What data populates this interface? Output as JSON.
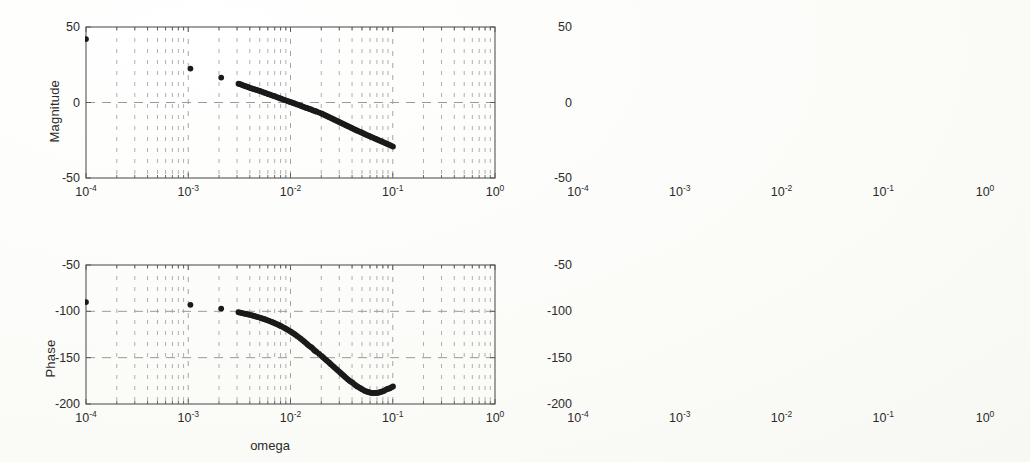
{
  "figure": {
    "kind": "bode-plot-figure",
    "panel_count": 4,
    "background_color": "#fdfdfb",
    "line_color": "#1a1a1a",
    "grid_color": "#9a9a9a",
    "axis_color": "#555555"
  },
  "labels": {
    "magnitude": "Magnitude",
    "phase": "Phase",
    "omega": "omega"
  },
  "x_ticks": [
    {
      "mantissa": "10",
      "exponent": "-4",
      "value": 0.0001
    },
    {
      "mantissa": "10",
      "exponent": "-3",
      "value": 0.001
    },
    {
      "mantissa": "10",
      "exponent": "-2",
      "value": 0.01
    },
    {
      "mantissa": "10",
      "exponent": "-1",
      "value": 0.1
    },
    {
      "mantissa": "10",
      "exponent": "0",
      "value": 1
    }
  ],
  "mag_y_ticks": [
    "50",
    "0",
    "-50"
  ],
  "phase_y_ticks": [
    "-50",
    "-100",
    "-150",
    "-200"
  ],
  "chart_data": [
    {
      "id": "magnitude-left",
      "type": "scatter",
      "title": "",
      "xlabel": "",
      "ylabel": "Magnitude",
      "xscale": "log",
      "xlim": [
        0.0001,
        1
      ],
      "ylim": [
        -50,
        50
      ],
      "yticks": [
        50,
        0,
        -50
      ],
      "xticks": [
        0.0001,
        0.001,
        0.01,
        0.1,
        1
      ],
      "grid": true,
      "legend": "none",
      "marker": "filled-circle",
      "x": [
        0.0001,
        0.00105,
        0.0021,
        0.0031,
        0.0041,
        0.0051,
        0.0061,
        0.0071,
        0.0081,
        0.0091,
        0.0101,
        0.0111,
        0.0121,
        0.0131,
        0.0141,
        0.0151,
        0.0161,
        0.0171,
        0.0181,
        0.0191,
        0.0201,
        0.0215,
        0.0231,
        0.0248,
        0.0266,
        0.0285,
        0.0306,
        0.0328,
        0.0352,
        0.0378,
        0.0405,
        0.0435,
        0.0466,
        0.05,
        0.0536,
        0.0575,
        0.0617,
        0.0662,
        0.071,
        0.0761,
        0.0816,
        0.0875,
        0.0938,
        0.1005
      ],
      "y": [
        42,
        22.5,
        16.5,
        12.5,
        9.5,
        7.5,
        5.5,
        4.0,
        2.5,
        1.3,
        0.2,
        -0.8,
        -1.7,
        -2.6,
        -3.4,
        -4.1,
        -4.8,
        -5.5,
        -6.1,
        -6.7,
        -7.3,
        -8.2,
        -9.2,
        -10.2,
        -11.2,
        -12.2,
        -13.2,
        -14.2,
        -15.2,
        -16.2,
        -17.2,
        -18.2,
        -19.1,
        -20.0,
        -21.0,
        -21.9,
        -22.8,
        -23.7,
        -24.6,
        -25.5,
        -26.4,
        -27.3,
        -28.2,
        -29.2
      ]
    },
    {
      "id": "magnitude-right",
      "type": "scatter",
      "title": "",
      "xlabel": "",
      "ylabel": "Magnitude",
      "xscale": "log",
      "xlim": [
        0.0001,
        1
      ],
      "ylim": [
        -50,
        50
      ],
      "yticks": [
        50,
        0,
        -50
      ],
      "xticks": [
        0.0001,
        0.001,
        0.01,
        0.1,
        1
      ],
      "grid": true,
      "legend": "none",
      "marker": "filled-circle",
      "x": [
        0.0001,
        0.00105,
        0.0021,
        0.0031,
        0.0041,
        0.0051,
        0.0061,
        0.0071,
        0.0081,
        0.0091,
        0.0101,
        0.0111,
        0.0121,
        0.0131,
        0.0141,
        0.0151,
        0.0161,
        0.0171,
        0.0181,
        0.0191,
        0.0201,
        0.0215,
        0.0231,
        0.0248,
        0.0266,
        0.0285,
        0.0306,
        0.0328,
        0.0352,
        0.0378,
        0.0405,
        0.0435,
        0.0466,
        0.05,
        0.0536,
        0.0575,
        0.0617,
        0.0662,
        0.071,
        0.0761,
        0.0816,
        0.0875,
        0.0938,
        0.1005
      ],
      "y": [
        42,
        22.5,
        16.5,
        12.5,
        9.5,
        7.5,
        5.5,
        4.0,
        2.5,
        1.3,
        0.2,
        -0.8,
        -1.7,
        -2.6,
        -3.4,
        -4.1,
        -4.8,
        -5.5,
        -6.1,
        -6.7,
        -7.3,
        -8.2,
        -9.2,
        -10.2,
        -11.2,
        -12.2,
        -13.2,
        -14.2,
        -15.2,
        -16.2,
        -17.2,
        -18.2,
        -19.1,
        -20.0,
        -21.0,
        -21.9,
        -22.8,
        -23.7,
        -24.6,
        -25.5,
        -26.4,
        -27.3,
        -28.2,
        -29.2
      ]
    },
    {
      "id": "phase-left",
      "type": "scatter",
      "title": "",
      "xlabel": "omega",
      "ylabel": "Phase",
      "xscale": "log",
      "xlim": [
        0.0001,
        1
      ],
      "ylim": [
        -200,
        -50
      ],
      "yticks": [
        -50,
        -100,
        -150,
        -200
      ],
      "xticks": [
        0.0001,
        0.001,
        0.01,
        0.1,
        1
      ],
      "grid": true,
      "legend": "none",
      "marker": "filled-circle",
      "x": [
        0.0001,
        0.00105,
        0.0021,
        0.0031,
        0.0041,
        0.0051,
        0.0061,
        0.0071,
        0.0081,
        0.0091,
        0.0101,
        0.0111,
        0.0121,
        0.0131,
        0.0141,
        0.0151,
        0.0161,
        0.0171,
        0.0181,
        0.0191,
        0.0201,
        0.0215,
        0.0231,
        0.0248,
        0.0266,
        0.0285,
        0.0306,
        0.0328,
        0.0352,
        0.0378,
        0.0405,
        0.0435,
        0.0466,
        0.05,
        0.0536,
        0.0575,
        0.0617,
        0.0662,
        0.071,
        0.0761,
        0.0816,
        0.0875,
        0.0938,
        0.1005
      ],
      "y": [
        -90,
        -93,
        -97,
        -101,
        -104,
        -107,
        -110,
        -113,
        -116,
        -119,
        -122,
        -125,
        -128,
        -131,
        -134,
        -137,
        -139,
        -142,
        -144,
        -146,
        -148,
        -151,
        -154,
        -157,
        -160,
        -163,
        -166,
        -169,
        -172,
        -175,
        -177,
        -180,
        -182,
        -184,
        -186,
        -187,
        -188,
        -188,
        -188,
        -187,
        -186,
        -184,
        -183,
        -181
      ]
    },
    {
      "id": "phase-right",
      "type": "scatter",
      "title": "",
      "xlabel": "omega",
      "ylabel": "Phase",
      "xscale": "log",
      "xlim": [
        0.0001,
        1
      ],
      "ylim": [
        -200,
        -50
      ],
      "yticks": [
        -50,
        -100,
        -150,
        -200
      ],
      "xticks": [
        0.0001,
        0.001,
        0.01,
        0.1,
        1
      ],
      "grid": true,
      "legend": "none",
      "marker": "filled-circle",
      "x": [
        0.0001,
        0.00105,
        0.0021,
        0.0031,
        0.0041,
        0.0051,
        0.0061,
        0.0071,
        0.0081,
        0.0091,
        0.0101,
        0.0111,
        0.0121,
        0.0131,
        0.0141,
        0.0151,
        0.0161,
        0.0171,
        0.0181,
        0.0191,
        0.0201,
        0.0215,
        0.0231,
        0.0248,
        0.0266,
        0.0285,
        0.0306,
        0.0328,
        0.0352,
        0.0378,
        0.0405,
        0.0435,
        0.0466,
        0.05,
        0.0536,
        0.0575,
        0.0617,
        0.0662,
        0.071,
        0.0761,
        0.0816,
        0.0875,
        0.0938,
        0.1005
      ],
      "y": [
        -90,
        -93,
        -97,
        -101,
        -104,
        -107,
        -110,
        -113,
        -116,
        -119,
        -122,
        -125,
        -128,
        -131,
        -134,
        -137,
        -139,
        -142,
        -144,
        -146,
        -148,
        -151,
        -154,
        -157,
        -160,
        -163,
        -166,
        -169,
        -172,
        -175,
        -177,
        -180,
        -182,
        -184,
        -186,
        -187,
        -188,
        -188,
        -188,
        -187,
        -186,
        -184,
        -183,
        -181
      ]
    }
  ],
  "panels": [
    {
      "id": "magnitude-left",
      "box": {
        "x": 86,
        "y": 27,
        "w": 409,
        "h": 151
      }
    },
    {
      "id": "magnitude-right",
      "box": {
        "x": 578,
        "y": 27,
        "w": 407,
        "h": 151
      }
    },
    {
      "id": "phase-left",
      "box": {
        "x": 86,
        "y": 265,
        "w": 409,
        "h": 139
      }
    },
    {
      "id": "phase-right",
      "box": {
        "x": 578,
        "y": 265,
        "w": 407,
        "h": 139
      }
    }
  ]
}
